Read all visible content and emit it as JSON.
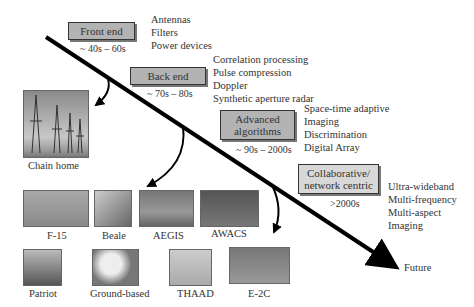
{
  "stages": [
    {
      "label": "Front end",
      "era": "~ 40s – 60s",
      "items": [
        "Antennas",
        "Filters",
        "Power devices"
      ]
    },
    {
      "label": "Back end",
      "era": "~ 70s – 80s",
      "items": [
        "Correlation processing",
        "Pulse compression",
        "Doppler",
        "Synthetic aperture radar"
      ]
    },
    {
      "label": "Advanced algorithms",
      "era": "~ 90s – 2000s",
      "items": [
        "Space-time adaptive",
        "Imaging",
        "Discrimination",
        "Digital Array"
      ]
    },
    {
      "label": "Collaborative/ network centric",
      "era": ">2000s",
      "items": [
        "Ultra-wideband",
        "Multi-frequency",
        "Multi-aspect",
        "Imaging"
      ]
    }
  ],
  "timeline_end_label": "Future",
  "systems": {
    "chain_home": "Chain home",
    "row1": [
      "F-15",
      "Beale",
      "AEGIS",
      "AWACS"
    ],
    "row2": [
      "Patriot",
      "Ground-based",
      "THAAD",
      "E-2C"
    ]
  },
  "colors": {
    "box_fill": "#b3b3b3",
    "box_fill_light": "#d8d8d8",
    "line": "#000000"
  }
}
